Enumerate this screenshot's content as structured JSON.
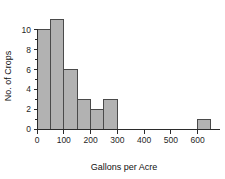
{
  "chart_data": {
    "type": "bar",
    "title": "",
    "xlabel": "Gallons per Acre",
    "ylabel": "No. of Crops",
    "bin_width": 50,
    "bin_starts": [
      0,
      50,
      100,
      150,
      200,
      250,
      300,
      350,
      400,
      450,
      500,
      550,
      600
    ],
    "categories": [
      "0-50",
      "50-100",
      "100-150",
      "150-200",
      "200-250",
      "250-300",
      "300-350",
      "350-400",
      "400-450",
      "450-500",
      "500-550",
      "550-600",
      "600-650"
    ],
    "values": [
      10,
      11,
      6,
      3,
      2,
      3,
      0,
      0,
      0,
      0,
      0,
      0,
      1
    ],
    "xlim": [
      -30,
      680
    ],
    "ylim": [
      0,
      11.6
    ],
    "x_ticks": [
      0,
      100,
      200,
      300,
      400,
      500,
      600
    ],
    "x_tick_labels": [
      "0",
      "100",
      "200",
      "300",
      "400",
      "500",
      "600"
    ],
    "y_ticks": [
      0,
      2,
      4,
      6,
      8,
      10
    ],
    "y_tick_labels": [
      "0",
      "2",
      "4",
      "6",
      "8",
      "10"
    ],
    "y_minor_ticks": [
      1,
      3,
      5,
      7,
      9
    ],
    "grid": false,
    "legend": null,
    "bar_fill_color": "#b2b2b2",
    "bar_edge_color": "#4a4a4a",
    "axis_color": "#2b2b2b"
  }
}
